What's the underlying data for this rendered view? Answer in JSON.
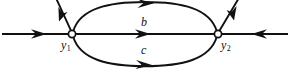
{
  "figure": {
    "type": "phase-line-diagram",
    "background_color": "#ffffff",
    "stroke_color": "#111111",
    "node_fill_color": "#ffffff"
  },
  "nodes": [
    {
      "id": "y1",
      "label": "y",
      "subscript": "1",
      "x": 72,
      "y": 34,
      "radius": 3.6,
      "filled": false
    },
    {
      "id": "y2",
      "label": "y",
      "subscript": "2",
      "x": 218,
      "y": 34,
      "radius": 3.6,
      "filled": false
    }
  ],
  "edge_labels": [
    {
      "id": "b",
      "text": "b",
      "x": 145,
      "y": 22
    },
    {
      "id": "c",
      "text": "c",
      "x": 145,
      "y": 50
    }
  ],
  "edges": [
    {
      "id": "left-axis",
      "kind": "straight",
      "from": "left-boundary",
      "to": "y1",
      "arrow_direction": "right",
      "arrow_at": {
        "x": 42,
        "y": 34
      }
    },
    {
      "id": "middle-connector",
      "kind": "straight",
      "from": "y1",
      "to": "y2",
      "arrow_direction": "right",
      "arrow_at": {
        "x": 146,
        "y": 34
      }
    },
    {
      "id": "right-axis",
      "kind": "straight",
      "from": "right-boundary",
      "to": "y2",
      "arrow_direction": "left",
      "arrow_at": {
        "x": 256,
        "y": 34
      }
    },
    {
      "id": "upper-arc",
      "kind": "arc",
      "from": "y1",
      "to": "y2",
      "label": "b",
      "arrow_direction": "right",
      "arrow_at": {
        "x": 150,
        "y": 4
      },
      "apex_y": 3
    },
    {
      "id": "lower-arc",
      "kind": "arc",
      "from": "y1",
      "to": "y2",
      "label": "c",
      "arrow_direction": "right",
      "arrow_at": {
        "x": 148,
        "y": 64
      },
      "apex_y": 66
    },
    {
      "id": "upper-left-ray",
      "kind": "straight",
      "from": "y1",
      "to": "upper-left-boundary",
      "arrow_direction": "up-left",
      "arrow_at": {
        "x": 60,
        "y": 13
      }
    },
    {
      "id": "upper-right-ray",
      "kind": "straight",
      "from": "y2",
      "to": "upper-right-boundary",
      "arrow_direction": "up-right",
      "arrow_at": {
        "x": 232,
        "y": 11
      }
    }
  ]
}
